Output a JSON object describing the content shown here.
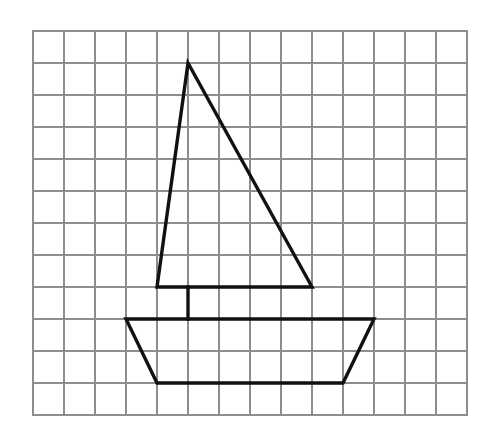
{
  "figure": {
    "background_color": "#ffffff",
    "caption": ""
  },
  "grid": {
    "name": "square-grid",
    "columns": 14,
    "rows": 12,
    "origin_x": 33,
    "origin_y": 31,
    "cell_width": 31,
    "cell_height": 32,
    "line_color": "#8d8d8d",
    "line_width": 2,
    "border_color": "#8d8d8d",
    "border_width": 2.4,
    "visible": true
  },
  "drawing": {
    "name": "sailboat",
    "stroke_color": "#111111",
    "stroke_width": 3.4,
    "fill": "none",
    "parts": [
      {
        "name": "sail",
        "shape": "triangle",
        "closed": true,
        "grid_points": [
          [
            5,
            1
          ],
          [
            4,
            8
          ],
          [
            9,
            8
          ]
        ],
        "points": "188,63 157,287 312,287"
      },
      {
        "name": "mast",
        "shape": "line",
        "closed": false,
        "grid_points": [
          [
            5,
            8
          ],
          [
            5,
            9
          ]
        ],
        "points": "188,287 188,319"
      },
      {
        "name": "hull",
        "shape": "trapezoid",
        "closed": true,
        "grid_points": [
          [
            3,
            9
          ],
          [
            11,
            9
          ],
          [
            10,
            11
          ],
          [
            4,
            11
          ]
        ],
        "points": "126,319 374,319 343,383 157,383"
      }
    ]
  },
  "chart_data": {
    "type": "scatter",
    "xlabel": "",
    "ylabel": "",
    "xlim": [
      0,
      14
    ],
    "ylim": [
      0,
      12
    ],
    "grid": true,
    "legend": "none",
    "series": [
      {
        "name": "sail",
        "x": [
          5,
          4,
          9,
          5
        ],
        "y": [
          11,
          4,
          4,
          11
        ]
      },
      {
        "name": "mast",
        "x": [
          5,
          5
        ],
        "y": [
          4,
          3
        ]
      },
      {
        "name": "hull",
        "x": [
          3,
          11,
          10,
          4,
          3
        ],
        "y": [
          3,
          3,
          1,
          1,
          3
        ]
      }
    ]
  }
}
